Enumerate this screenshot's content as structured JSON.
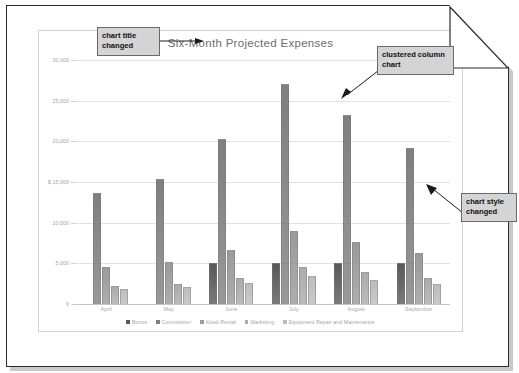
{
  "document": {
    "name": "printed-page-with-folded-corner"
  },
  "chart_data": {
    "type": "bar",
    "title": "Six-Month Projected Expenses",
    "xlabel": "",
    "ylabel": "",
    "ylim": [
      0,
      30000
    ],
    "ytick_values": [
      30000,
      25000,
      20000,
      15000,
      10000,
      5000,
      0
    ],
    "ytick_labels": [
      "30,000",
      "25,000",
      "20,000",
      "$ 15,000",
      "10,000",
      "5,000",
      "0"
    ],
    "grid": true,
    "legend_position": "bottom",
    "categories": [
      "April",
      "May",
      "June",
      "July",
      "August",
      "September"
    ],
    "series": [
      {
        "name": "Bonus",
        "color": "#595959",
        "values": [
          0,
          0,
          5000,
          5000,
          5000,
          5000
        ]
      },
      {
        "name": "Commission",
        "color": "#7f7f7f",
        "values": [
          13700,
          15400,
          20300,
          27000,
          23300,
          19200
        ]
      },
      {
        "name": "Kiosk Rental",
        "color": "#9a9a9a",
        "values": [
          4500,
          5200,
          6700,
          9000,
          7600,
          6300
        ]
      },
      {
        "name": "Marketing",
        "color": "#ababab",
        "values": [
          2200,
          2500,
          3200,
          4500,
          3900,
          3200
        ]
      },
      {
        "name": "Equipment Repair and Maintenance",
        "color": "#bdbdbd",
        "values": [
          1800,
          2100,
          2600,
          3500,
          3000,
          2500
        ]
      }
    ]
  },
  "annotations": [
    {
      "id": "chart-title-changed",
      "text": "chart title\nchanged"
    },
    {
      "id": "clustered-column-chart",
      "text": "clustered column\nchart"
    },
    {
      "id": "chart-style-changed",
      "text": "chart style\nchanged"
    }
  ],
  "annotation_text": {
    "title_changed": "chart title changed",
    "clustered": "clustered column chart",
    "style_changed": "chart style changed"
  }
}
